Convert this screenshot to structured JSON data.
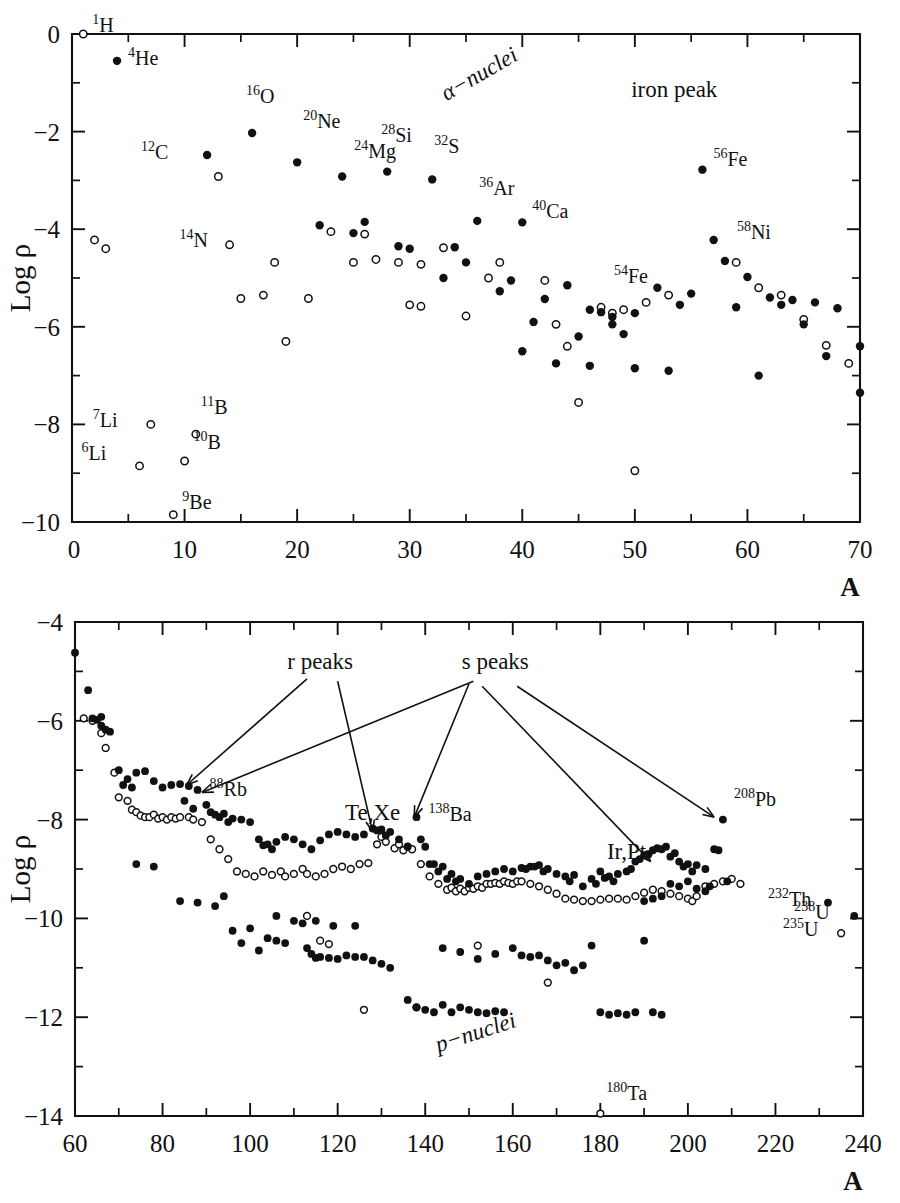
{
  "figure": {
    "panels": [
      "upper",
      "lower"
    ]
  },
  "chart_data": [
    {
      "type": "scatter",
      "id": "upper-panel",
      "title": "",
      "xlabel": "A",
      "ylabel": "Log ρ",
      "xlim": [
        0,
        70
      ],
      "ylim": [
        -10,
        0
      ],
      "xticks": [
        0,
        10,
        20,
        30,
        40,
        50,
        60,
        70
      ],
      "xtick_labels": [
        "0",
        "10",
        "20",
        "30",
        "40",
        "50",
        "60",
        "70"
      ],
      "xticks_minor": [
        5,
        15,
        25,
        35,
        45,
        55,
        65
      ],
      "yticks": [
        0,
        -2,
        -4,
        -6,
        -8,
        -10
      ],
      "ytick_labels": [
        "0",
        "-2",
        "-4",
        "-6",
        "-8",
        "-10"
      ],
      "yticks_minor": [
        -1,
        -3,
        -5,
        -7,
        -9
      ],
      "grid": false,
      "legend": "none",
      "series": [
        {
          "name": "even-A / filled",
          "marker": "filled-circle",
          "points": [
            [
              4,
              -0.55
            ],
            [
              12,
              -2.48
            ],
            [
              16,
              -2.03
            ],
            [
              20,
              -2.63
            ],
            [
              22,
              -3.92
            ],
            [
              24,
              -2.92
            ],
            [
              25,
              -4.08
            ],
            [
              26,
              -3.85
            ],
            [
              28,
              -2.82
            ],
            [
              29,
              -4.35
            ],
            [
              30,
              -4.4
            ],
            [
              32,
              -2.98
            ],
            [
              33,
              -5.0
            ],
            [
              34,
              -4.37
            ],
            [
              36,
              -3.83
            ],
            [
              35,
              -4.68
            ],
            [
              38,
              -5.27
            ],
            [
              40,
              -3.86
            ],
            [
              39,
              -5.05
            ],
            [
              41,
              -5.9
            ],
            [
              42,
              -5.43
            ],
            [
              43,
              -6.75
            ],
            [
              44,
              -5.15
            ],
            [
              45,
              -6.2
            ],
            [
              46,
              -5.65
            ],
            [
              47,
              -5.7
            ],
            [
              48,
              -5.8
            ],
            [
              50,
              -5.72
            ],
            [
              49,
              -6.15
            ],
            [
              52,
              -5.2
            ],
            [
              54,
              -5.55
            ],
            [
              56,
              -2.78
            ],
            [
              55,
              -5.32
            ],
            [
              57,
              -4.22
            ],
            [
              58,
              -4.65
            ],
            [
              59,
              -5.6
            ],
            [
              60,
              -4.98
            ],
            [
              61,
              -7.0
            ],
            [
              62,
              -5.4
            ],
            [
              63,
              -5.55
            ],
            [
              64,
              -5.45
            ],
            [
              65,
              -5.95
            ],
            [
              66,
              -5.5
            ],
            [
              67,
              -6.6
            ],
            [
              68,
              -5.62
            ],
            [
              70,
              -6.4
            ],
            [
              70,
              -7.35
            ],
            [
              46,
              -6.8
            ],
            [
              48,
              -5.95
            ],
            [
              40,
              -6.5
            ],
            [
              53,
              -6.9
            ],
            [
              50,
              -6.85
            ]
          ]
        },
        {
          "name": "odd-A / open",
          "marker": "open-circle",
          "points": [
            [
              1,
              0.0
            ],
            [
              2,
              -4.22
            ],
            [
              3,
              -4.4
            ],
            [
              6,
              -8.85
            ],
            [
              7,
              -8.0
            ],
            [
              9,
              -9.85
            ],
            [
              10,
              -8.75
            ],
            [
              11,
              -8.2
            ],
            [
              13,
              -2.92
            ],
            [
              14,
              -4.32
            ],
            [
              15,
              -5.42
            ],
            [
              17,
              -5.35
            ],
            [
              18,
              -4.68
            ],
            [
              19,
              -6.3
            ],
            [
              21,
              -5.42
            ],
            [
              23,
              -4.05
            ],
            [
              26,
              -4.1
            ],
            [
              27,
              -4.62
            ],
            [
              31,
              -4.72
            ],
            [
              33,
              -4.38
            ],
            [
              37,
              -5.0
            ],
            [
              35,
              -5.78
            ],
            [
              38,
              -4.68
            ],
            [
              42,
              -5.05
            ],
            [
              43,
              -5.95
            ],
            [
              44,
              -6.4
            ],
            [
              45,
              -7.55
            ],
            [
              47,
              -5.6
            ],
            [
              48,
              -5.72
            ],
            [
              49,
              -5.65
            ],
            [
              50,
              -8.95
            ],
            [
              51,
              -5.5
            ],
            [
              53,
              -5.35
            ],
            [
              59,
              -4.68
            ],
            [
              61,
              -5.2
            ],
            [
              63,
              -5.35
            ],
            [
              65,
              -5.85
            ],
            [
              67,
              -6.38
            ],
            [
              69,
              -6.75
            ],
            [
              29,
              -4.68
            ],
            [
              31,
              -5.58
            ],
            [
              25,
              -4.68
            ],
            [
              30,
              -5.55
            ]
          ]
        }
      ],
      "point_labels": [
        {
          "sup": "1",
          "el": "H",
          "x": 1,
          "y": 0.0,
          "dx": 9,
          "dy": -2
        },
        {
          "sup": "4",
          "el": "He",
          "x": 4,
          "y": -0.55,
          "dx": 11,
          "dy": 4
        },
        {
          "sup": "16",
          "el": "O",
          "x": 16,
          "y": -2.03,
          "dx": -6,
          "dy": -30
        },
        {
          "sup": "20",
          "el": "Ne",
          "x": 20,
          "y": -2.63,
          "dx": 6,
          "dy": -34
        },
        {
          "sup": "12",
          "el": "C",
          "x": 12,
          "y": -2.48,
          "dx": -66,
          "dy": 4
        },
        {
          "sup": "24",
          "el": "Mg",
          "x": 24,
          "y": -2.92,
          "dx": 12,
          "dy": -18
        },
        {
          "sup": "28",
          "el": "Si",
          "x": 28,
          "y": -2.82,
          "dx": -6,
          "dy": -30
        },
        {
          "sup": "14",
          "el": "N",
          "x": 14,
          "y": -4.32,
          "dx": -50,
          "dy": 2
        },
        {
          "sup": "32",
          "el": "S",
          "x": 32,
          "y": -2.98,
          "dx": 2,
          "dy": -26
        },
        {
          "sup": "36",
          "el": "Ar",
          "x": 36,
          "y": -3.83,
          "dx": 2,
          "dy": -26
        },
        {
          "sup": "40",
          "el": "Ca",
          "x": 40,
          "y": -3.86,
          "dx": 10,
          "dy": -4
        },
        {
          "sup": "54",
          "el": "Fe",
          "x": 54,
          "y": -5.55,
          "dx": -66,
          "dy": -22
        },
        {
          "sup": "56",
          "el": "Fe",
          "x": 56,
          "y": -2.78,
          "dx": 11,
          "dy": -4
        },
        {
          "sup": "58",
          "el": "Ni",
          "x": 58,
          "y": -4.65,
          "dx": 12,
          "dy": -22
        },
        {
          "sup": "7",
          "el": "Li",
          "x": 7,
          "y": -8.0,
          "dx": -58,
          "dy": 3
        },
        {
          "sup": "6",
          "el": "Li",
          "x": 6,
          "y": -8.85,
          "dx": -58,
          "dy": -6
        },
        {
          "sup": "11",
          "el": "B",
          "x": 11,
          "y": -8.2,
          "dx": 5,
          "dy": -20
        },
        {
          "sup": "10",
          "el": "B",
          "x": 10,
          "y": -8.75,
          "dx": 9,
          "dy": -12
        },
        {
          "sup": "9",
          "el": "Be",
          "x": 9,
          "y": -9.85,
          "dx": 9,
          "dy": -6
        }
      ],
      "annotations": [
        {
          "text": "α-nuclei",
          "x": 36.5,
          "y": -0.95,
          "rotation": -30,
          "style": "italic-greek"
        },
        {
          "text": "iron peak",
          "x": 53.5,
          "y": -1.3,
          "rotation": 0,
          "style": "roman"
        }
      ]
    },
    {
      "type": "scatter",
      "id": "lower-panel",
      "title": "",
      "xlabel": "A",
      "ylabel": "Log ρ",
      "xlim": [
        60,
        240
      ],
      "ylim": [
        -14,
        -4
      ],
      "xticks": [
        60,
        80,
        100,
        120,
        140,
        160,
        180,
        200,
        220,
        240
      ],
      "xtick_labels": [
        "60",
        "80",
        "100",
        "120",
        "140",
        "160",
        "180",
        "200",
        "220",
        "240"
      ],
      "xticks_minor": [
        70,
        90,
        110,
        130,
        150,
        170,
        190,
        210,
        230
      ],
      "yticks": [
        -4,
        -6,
        -8,
        -10,
        -12,
        -14
      ],
      "ytick_labels": [
        "-4",
        "-6",
        "-8",
        "-10",
        "-12",
        "-14"
      ],
      "yticks_minor": [
        -5,
        -7,
        -9,
        -11,
        -13
      ],
      "grid": false,
      "legend": "none",
      "point_labels": [
        {
          "sup": "88",
          "el": "Rb",
          "x": 88,
          "y": -7.4,
          "dx": 12,
          "dy": 6
        },
        {
          "sup": "138",
          "el": "Ba",
          "x": 138,
          "y": -7.95,
          "dx": 12,
          "dy": 4
        },
        {
          "sup": "208",
          "el": "Pb",
          "x": 208,
          "y": -8.0,
          "dx": 11,
          "dy": -14
        },
        {
          "sup": "232",
          "el": "Th",
          "x": 232,
          "y": -9.68,
          "dx": -60,
          "dy": 3
        },
        {
          "sup": "238",
          "el": "U",
          "x": 238,
          "y": -9.95,
          "dx": -60,
          "dy": 3
        },
        {
          "sup": "235",
          "el": "U",
          "x": 235,
          "y": -10.3,
          "dx": -58,
          "dy": 3
        },
        {
          "sup": "180",
          "el": "Ta",
          "x": 180,
          "y": -13.95,
          "dx": 6,
          "dy": -14
        }
      ],
      "annotations": [
        {
          "text": "r peaks",
          "x": 116,
          "y": -4.95,
          "rotation": 0,
          "style": "roman"
        },
        {
          "text": "s peaks",
          "x": 156,
          "y": -4.95,
          "rotation": 0,
          "style": "roman"
        },
        {
          "text": "Te,Xe",
          "x": 128,
          "y": -8.0,
          "rotation": 0,
          "style": "roman"
        },
        {
          "text": "Ir,Pt",
          "x": 186,
          "y": -8.8,
          "rotation": 0,
          "style": "roman"
        },
        {
          "text": "p-nuclei",
          "x": 152,
          "y": -12.45,
          "rotation": -18,
          "style": "italic"
        }
      ],
      "arrows": [
        {
          "label": "r peaks",
          "from": [
            113,
            -5.15
          ],
          "to": [
            85.5,
            -7.3
          ]
        },
        {
          "label": "r peaks",
          "from": [
            120,
            -5.2
          ],
          "to": [
            128,
            -8.25
          ]
        },
        {
          "label": "s peaks",
          "from": [
            151,
            -5.2
          ],
          "to": [
            89,
            -7.45
          ]
        },
        {
          "label": "s peaks",
          "from": [
            150,
            -5.25
          ],
          "to": [
            137.5,
            -7.95
          ]
        },
        {
          "label": "s peaks",
          "from": [
            153,
            -5.3
          ],
          "to": [
            191.5,
            -8.85
          ]
        },
        {
          "label": "s peaks",
          "from": [
            161,
            -5.3
          ],
          "to": [
            206,
            -7.95
          ]
        }
      ]
    }
  ],
  "axes": {
    "upper": {
      "ylabel": "Log ρ",
      "xlabel": "A",
      "xtick_labels": [
        "0",
        "10",
        "20",
        "30",
        "40",
        "50",
        "60",
        "70"
      ],
      "ytick_labels": [
        "0",
        "-2",
        "-4",
        "-6",
        "-8",
        "-10"
      ]
    },
    "lower": {
      "ylabel": "Log ρ",
      "xlabel": "A",
      "xtick_labels": [
        "60",
        "80",
        "100",
        "120",
        "140",
        "160",
        "180",
        "200",
        "220",
        "240"
      ],
      "ytick_labels": [
        "-4",
        "-6",
        "-8",
        "-10",
        "-12",
        "-14"
      ]
    }
  },
  "colors": {
    "ink": "#111111",
    "paper": "#ffffff",
    "marker_fill": "#111111",
    "marker_open": "#ffffff"
  }
}
